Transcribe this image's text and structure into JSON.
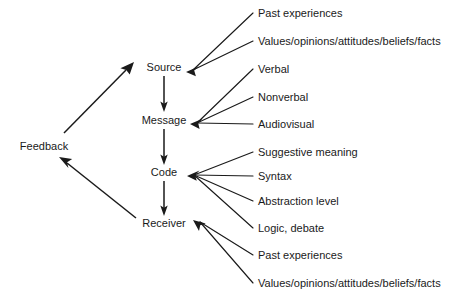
{
  "diagram": {
    "colors": {
      "line": "#1a1a1a",
      "text": "#1a1a1a",
      "background": "#ffffff"
    },
    "spine_nodes": [
      {
        "id": "source",
        "label": "Source"
      },
      {
        "id": "message",
        "label": "Message"
      },
      {
        "id": "code",
        "label": "Code"
      },
      {
        "id": "receiver",
        "label": "Receiver"
      }
    ],
    "feedback_node": {
      "id": "feedback",
      "label": "Feedback"
    },
    "branches": [
      {
        "parent": "source",
        "label": "Past experiences"
      },
      {
        "parent": "source",
        "label": "Values/opinions/attitudes/beliefs/facts"
      },
      {
        "parent": "message",
        "label": "Verbal"
      },
      {
        "parent": "message",
        "label": "Nonverbal"
      },
      {
        "parent": "message",
        "label": "Audiovisual"
      },
      {
        "parent": "code",
        "label": "Suggestive meaning"
      },
      {
        "parent": "code",
        "label": "Syntax"
      },
      {
        "parent": "code",
        "label": "Abstraction level"
      },
      {
        "parent": "code",
        "label": "Logic, debate"
      },
      {
        "parent": "receiver",
        "label": "Past experiences"
      },
      {
        "parent": "receiver",
        "label": "Values/opinions/attitudes/beliefs/facts"
      }
    ],
    "flow_edges": [
      {
        "from": "source",
        "to": "message"
      },
      {
        "from": "message",
        "to": "code"
      },
      {
        "from": "code",
        "to": "receiver"
      },
      {
        "from": "receiver",
        "to": "feedback"
      },
      {
        "from": "feedback",
        "to": "source"
      }
    ]
  }
}
